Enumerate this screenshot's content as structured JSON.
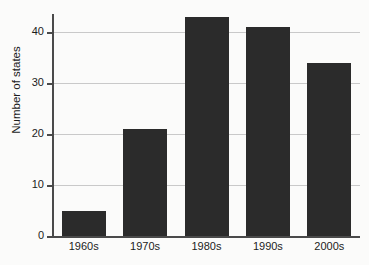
{
  "chart_data": {
    "type": "bar",
    "title": "",
    "subtitle": "",
    "xlabel": "",
    "ylabel": "Number of states",
    "categories": [
      "1960s",
      "1970s",
      "1980s",
      "1990s",
      "2000s"
    ],
    "values": [
      5,
      21,
      43,
      41,
      34
    ],
    "series": [
      {
        "name": "Number of states",
        "values": [
          5,
          21,
          43,
          41,
          34
        ]
      }
    ],
    "ylim": [
      0,
      45
    ],
    "y_ticks": [
      0,
      10,
      20,
      30,
      40
    ],
    "y_tick_labels": [
      "0",
      "10",
      "20",
      "30",
      "40"
    ],
    "x_tick_labels": [
      "1960s",
      "1970s",
      "1980s",
      "1990s",
      "2000s"
    ],
    "grid": "horizontal",
    "legend": "none",
    "bar_color": "#2b2b2b",
    "grid_color": "#c9c9c9",
    "axis_color": "#4a4a4a",
    "background_color": "#fbfbfa",
    "text_color": "#1c1c1c",
    "annotations": []
  }
}
